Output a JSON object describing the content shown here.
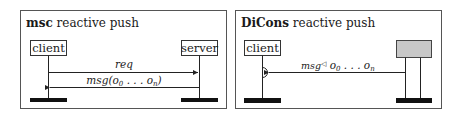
{
  "panels": [
    {
      "id": "msc",
      "title_bold": "msc",
      "title_rest": " reactive push",
      "participants": [
        {
          "label": "client"
        },
        {
          "label": "server"
        }
      ],
      "messages": [
        {
          "label": "req",
          "direction": "client-to-server"
        },
        {
          "label_main": "msg(o",
          "sub0": "0",
          "label_mid": " . . . o",
          "subn": "n",
          "label_end": ")",
          "direction": "server-to-client"
        }
      ]
    },
    {
      "id": "dicons",
      "title_bold": "DiCons",
      "title_rest": " reactive push",
      "participants": [
        {
          "label": "client"
        },
        {
          "label": "",
          "fill": "#c8c8c8"
        }
      ],
      "messages": [
        {
          "label_main": "msg",
          "triangle": "◁",
          "label_o": " o",
          "sub0": "0",
          "label_mid": " . . . o",
          "subn": "n",
          "direction": "server-to-client"
        }
      ]
    }
  ],
  "colors": {
    "frame": "#555555",
    "line": "#222222",
    "bar": "#111111",
    "grey_box": "#c8c8c8"
  }
}
